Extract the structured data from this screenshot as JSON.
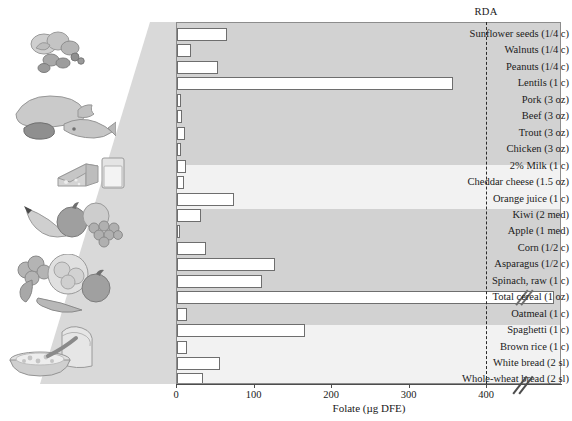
{
  "chart_data": {
    "type": "bar",
    "orientation": "horizontal",
    "title": "",
    "xlabel": "Folate (µg DFE)",
    "ylabel": "",
    "xlim": [
      0,
      420
    ],
    "xticks": [
      0,
      100,
      200,
      300,
      400
    ],
    "xtick_labels": [
      "0",
      "100",
      "200",
      "300",
      "400"
    ],
    "grid": false,
    "axis_break": true,
    "axis_break_note": "x-axis is broken after 400 to accommodate Total cereal",
    "legend": "",
    "annotations": [
      {
        "name": "rda",
        "label": "RDA",
        "value": 400,
        "style": "dashed vertical line"
      }
    ],
    "categories": [
      "Sunflower seeds (1/4 c)",
      "Walnuts (1/4 c)",
      "Peanuts (1/4 c)",
      "Lentils (1 c)",
      "Pork (3 oz)",
      "Beef (3 oz)",
      "Trout (3 oz)",
      "Chicken (3 oz)",
      "2% Milk (1 c)",
      "Cheddar cheese (1.5 oz)",
      "Orange juice (1 c)",
      "Kiwi (2 med)",
      "Apple (1 med)",
      "Corn (1/2 c)",
      "Asparagus (1/2 c)",
      "Spinach, raw (1 c)",
      "Total cereal (1 oz)",
      "Oatmeal (1 c)",
      "Spaghetti (1 c)",
      "Brown rice (1 c)",
      "White bread (2 sl)",
      "Whole-wheat bread (2 sl)"
    ],
    "values": [
      64,
      18,
      53,
      356,
      5,
      6,
      10,
      5,
      12,
      9,
      74,
      31,
      4,
      38,
      127,
      110,
      400,
      13,
      165,
      13,
      56,
      34
    ],
    "broken_bars": [
      "Total cereal (1 oz)"
    ]
  },
  "food_groups": [
    {
      "name": "nuts-and-legumes",
      "art": "peanuts-and-nuts"
    },
    {
      "name": "meat-and-fish",
      "art": "pork-beef-trout"
    },
    {
      "name": "dairy",
      "art": "cheese-and-milk"
    },
    {
      "name": "fruits",
      "art": "banana-apple-grapes"
    },
    {
      "name": "vegetables",
      "art": "broccoli-lettuce-tomato-carrot"
    },
    {
      "name": "grains",
      "art": "bread-and-cereal-bowl"
    }
  ],
  "colors": {
    "plot_background": "#d9d9d9",
    "band_light": "#f2f2f2",
    "band_dark": "#d2d2d2",
    "bar_fill": "#ffffff",
    "bar_stroke": "#6e6e6e",
    "axis": "#4d4d4d",
    "rda_line": "#2b2b2b",
    "text": "#1a1a1a"
  }
}
